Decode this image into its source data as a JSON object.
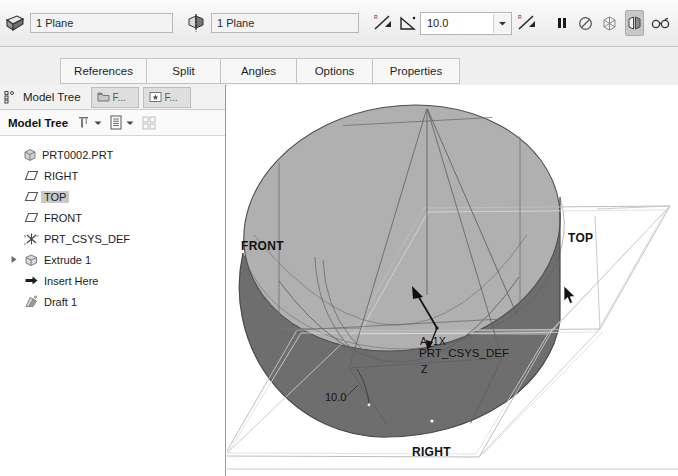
{
  "dashboard": {
    "collector1": {
      "icon": "plane-reference-icon",
      "value": "1 Plane"
    },
    "collector2": {
      "icon": "pull-direction-icon",
      "value": "1 Plane"
    },
    "flip1_icon": "flip-direction-icon",
    "angle_icon": "draft-angle-icon",
    "angle_value": "10.0",
    "angle_dropdown_icon": "chevron-down-icon",
    "flip2_icon": "flip-angle-icon",
    "buttons": [
      {
        "name": "pause-button",
        "icon": "pause-icon",
        "active": false
      },
      {
        "name": "resume-button",
        "icon": "no-entry-icon",
        "active": false
      },
      {
        "name": "feature-preview-button",
        "icon": "wireframe-preview-icon",
        "active": false
      },
      {
        "name": "preview-geometry-button",
        "icon": "split-preview-icon",
        "active": true
      },
      {
        "name": "glasses-preview-button",
        "icon": "glasses-icon",
        "active": false
      },
      {
        "name": "accept-button",
        "icon": "checkmark-icon",
        "active": true
      },
      {
        "name": "cancel-button",
        "icon": "close-x-icon",
        "active": false
      }
    ]
  },
  "tabs": [
    {
      "label": "References"
    },
    {
      "label": "Split"
    },
    {
      "label": "Angles"
    },
    {
      "label": "Options"
    },
    {
      "label": "Properties"
    }
  ],
  "left_panel": {
    "navigator_icon": "navigator-icon",
    "title": "Model Tree",
    "panel_tabs": [
      {
        "icon": "folder-browser-icon",
        "label": "F..."
      },
      {
        "icon": "favorites-icon",
        "label": "F..."
      }
    ],
    "toolbar": {
      "label": "Model Tree",
      "filter_icon": "filter-icon",
      "filter_caret_icon": "chevron-down-icon",
      "settings_icon": "tree-settings-icon",
      "settings_caret_icon": "chevron-down-icon",
      "columns_icon": "tree-columns-icon"
    },
    "tree": [
      {
        "label": "PRT0002.PRT",
        "icon": "part-icon",
        "level": 0,
        "expander": "none",
        "selected": false
      },
      {
        "label": "RIGHT",
        "icon": "datum-plane-icon",
        "level": 1,
        "expander": "none",
        "selected": false
      },
      {
        "label": "TOP",
        "icon": "datum-plane-icon",
        "level": 1,
        "expander": "none",
        "selected": true
      },
      {
        "label": "FRONT",
        "icon": "datum-plane-icon",
        "level": 1,
        "expander": "none",
        "selected": false
      },
      {
        "label": "PRT_CSYS_DEF",
        "icon": "coordinate-system-icon",
        "level": 1,
        "expander": "none",
        "selected": false
      },
      {
        "label": "Extrude 1",
        "icon": "extrude-feature-icon",
        "level": 1,
        "expander": "collapsed",
        "selected": false
      },
      {
        "label": "Insert Here",
        "icon": "insert-here-icon",
        "level": 1,
        "expander": "none",
        "selected": false
      },
      {
        "label": "Draft 1",
        "icon": "draft-feature-icon",
        "level": 1,
        "expander": "none",
        "selected": false
      }
    ]
  },
  "viewport": {
    "labels": {
      "front_plane": "FRONT",
      "top_plane": "TOP",
      "right_plane": "RIGHT",
      "csys": "PRT_CSYS_DEF",
      "axis_a1": "A_1X",
      "axis_z": "Z",
      "dimension": "10.0"
    },
    "colors": {
      "top_face": "#b0b0b0",
      "shaded_face": "#6e6e6e",
      "outline": "#4a4a4a",
      "datum_line": "#9a9a9a"
    },
    "cursor_icon": "mouse-pointer-icon"
  }
}
